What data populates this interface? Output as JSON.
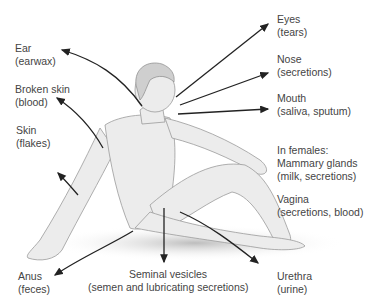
{
  "diagram": {
    "labels": [
      {
        "id": "ear",
        "name": "Ear",
        "detail": "(earwax)"
      },
      {
        "id": "broken-skin",
        "name": "Broken skin",
        "detail": "(blood)"
      },
      {
        "id": "skin",
        "name": "Skin",
        "detail": "(flakes)"
      },
      {
        "id": "eyes",
        "name": "Eyes",
        "detail": "(tears)"
      },
      {
        "id": "nose",
        "name": "Nose",
        "detail": "(secretions)"
      },
      {
        "id": "mouth",
        "name": "Mouth",
        "detail": "(saliva, sputum)"
      },
      {
        "id": "mammary",
        "prefix": "In females:",
        "name": "Mammary glands",
        "detail": "(milk, secretions)"
      },
      {
        "id": "vagina",
        "name": "Vagina",
        "detail": "(secretions, blood)"
      },
      {
        "id": "anus",
        "name": "Anus",
        "detail": "(feces)"
      },
      {
        "id": "seminal",
        "name": "Seminal vesicles",
        "detail": "(semen and lubricating secretions)"
      },
      {
        "id": "urethra",
        "name": "Urethra",
        "detail": "(urine)"
      }
    ]
  }
}
